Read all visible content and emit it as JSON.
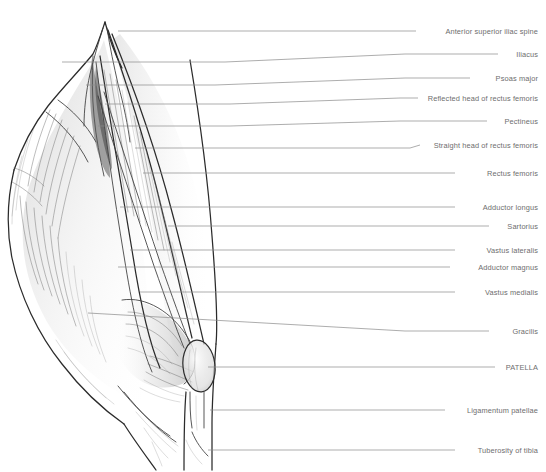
{
  "figure": {
    "medium": "graphite-pencil-drawing",
    "background_color": "#ffffff",
    "label_color": "#6e6e6e",
    "leader_line_color": "#8a8a8a",
    "outline_color": "#2b2b2b"
  },
  "labels": [
    {
      "id": "anterior-superior-iliac-spine",
      "text": "Anterior superior iliac spine",
      "y": 31
    },
    {
      "id": "iliacus",
      "text": "Iliacus",
      "y": 54
    },
    {
      "id": "psoas-major",
      "text": "Psoas major",
      "y": 78
    },
    {
      "id": "reflected-head-of-rectus-femoris",
      "text": "Reflected head of rectus femoris",
      "y": 98
    },
    {
      "id": "pectineus",
      "text": "Pectineus",
      "y": 121
    },
    {
      "id": "straight-head-of-rectus-femoris",
      "text": "Straight head of rectus femoris",
      "y": 145
    },
    {
      "id": "rectus-femoris",
      "text": "Rectus femoris",
      "y": 173
    },
    {
      "id": "adductor-longus",
      "text": "Adductor longus",
      "y": 207
    },
    {
      "id": "sartorius",
      "text": "Sartorius",
      "y": 226
    },
    {
      "id": "vastus-lateralis",
      "text": "Vastus lateralis",
      "y": 250
    },
    {
      "id": "adductor-magnus",
      "text": "Adductor magnus",
      "y": 267
    },
    {
      "id": "vastus-medialis",
      "text": "Vastus medialis",
      "y": 292
    },
    {
      "id": "gracilis",
      "text": "Gracilis",
      "y": 331
    },
    {
      "id": "patella",
      "text": "PATELLA",
      "y": 367
    },
    {
      "id": "ligamentum-patellae",
      "text": "Ligamentum patellae",
      "y": 410
    },
    {
      "id": "tuberosity-of-tibia",
      "text": "Tuberosity of tibia",
      "y": 450
    }
  ],
  "leader_lines": [
    {
      "id": "leader-anterior-superior-iliac-spine",
      "points": "118,31 416,31"
    },
    {
      "id": "leader-iliacus",
      "points": "62,62 225,62 405,54 498,54"
    },
    {
      "id": "leader-psoas-major",
      "points": "86,85 215,85 405,78 470,78"
    },
    {
      "id": "leader-reflected-head-of-rectus-femoris",
      "points": "105,104 230,104 400,98 418,98"
    },
    {
      "id": "leader-pectineus",
      "points": "98,126 230,126 400,121 487,121"
    },
    {
      "id": "leader-straight-head-of-rectus-femoris",
      "points": "135,148 410,148 418,145"
    },
    {
      "id": "leader-rectus-femoris",
      "points": "143,173 455,173"
    },
    {
      "id": "leader-adductor-longus",
      "points": "120,207 455,207"
    },
    {
      "id": "leader-sartorius",
      "points": "168,226 489,226"
    },
    {
      "id": "leader-vastus-lateralis",
      "points": "130,250 455,250"
    },
    {
      "id": "leader-adductor-magnus",
      "points": "118,267 450,267"
    },
    {
      "id": "leader-vastus-medialis",
      "points": "140,292 455,292"
    },
    {
      "id": "leader-gracilis",
      "points": "88,313 405,331 489,331"
    },
    {
      "id": "leader-patella",
      "points": "208,367 495,367"
    },
    {
      "id": "leader-ligamentum-patellae",
      "points": "210,410 445,410"
    },
    {
      "id": "leader-tuberosity-of-tibia",
      "points": "208,450 455,450"
    }
  ]
}
